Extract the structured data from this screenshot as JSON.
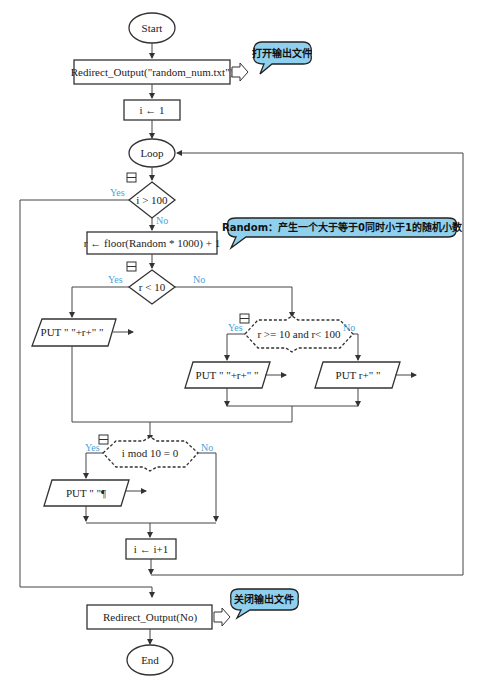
{
  "nodes": {
    "start": "Start",
    "redirect_open": "Redirect_Output(\"random_num.txt\")",
    "init_i": "i ← 1",
    "loop": "Loop",
    "cond_i": "i > 100",
    "assign_r": "r ← floor(Random  *  1000) + 1",
    "cond_r10": "r < 10",
    "put_small": "PUT \" \"+r+\" \"",
    "cond_r100": "r >= 10 and r< 100",
    "put_mid": "PUT \" \"+r+\" \"",
    "put_big": "PUT r+\" \"",
    "cond_mod": "i mod 10 = 0",
    "put_newline": "PUT \" \"¶",
    "incr_i": "i ← i+1",
    "redirect_close": "Redirect_Output(No)",
    "end": "End"
  },
  "labels": {
    "yes": "Yes",
    "no": "No"
  },
  "callouts": {
    "open_file": "打开输出文件",
    "random_note": "Random：产生一个大于等于0同时小于1的随机小数",
    "close_file": "关闭输出文件"
  },
  "colors": {
    "callout_fill": "#8fd0ef",
    "branch_label": "#4aa3d8",
    "stroke": "#333333"
  }
}
